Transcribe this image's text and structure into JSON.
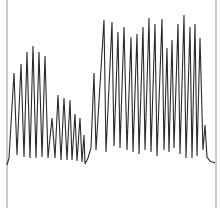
{
  "chart_data": {
    "type": "line",
    "title": "",
    "xlabel": "",
    "ylabel": "",
    "grid": false,
    "legend": null,
    "frame": {
      "left_x": 7,
      "right_x": 216,
      "color": "#9a9a9a"
    },
    "line_color": "#2a2a2a",
    "series": [
      {
        "name": "waveform",
        "points": [
          [
            7,
            165
          ],
          [
            9,
            158
          ],
          [
            14,
            73
          ],
          [
            17,
            155
          ],
          [
            21,
            64
          ],
          [
            24,
            157
          ],
          [
            27,
            52
          ],
          [
            30,
            158
          ],
          [
            33,
            46
          ],
          [
            36,
            158
          ],
          [
            39,
            52
          ],
          [
            42,
            157
          ],
          [
            45,
            56
          ],
          [
            48,
            158
          ],
          [
            52,
            118
          ],
          [
            55,
            158
          ],
          [
            58,
            95
          ],
          [
            61,
            160
          ],
          [
            64,
            98
          ],
          [
            67,
            160
          ],
          [
            70,
            100
          ],
          [
            72,
            160
          ],
          [
            75,
            114
          ],
          [
            77,
            161
          ],
          [
            80,
            118
          ],
          [
            82,
            162
          ],
          [
            84,
            135
          ],
          [
            85,
            164
          ],
          [
            88,
            158
          ],
          [
            91,
            148
          ],
          [
            94,
            73
          ],
          [
            96,
            150
          ],
          [
            104,
            20
          ],
          [
            106,
            152
          ],
          [
            112,
            22
          ],
          [
            114,
            146
          ],
          [
            118,
            32
          ],
          [
            120,
            148
          ],
          [
            124,
            27
          ],
          [
            127,
            150
          ],
          [
            131,
            37
          ],
          [
            133,
            152
          ],
          [
            137,
            34
          ],
          [
            139,
            154
          ],
          [
            143,
            27
          ],
          [
            145,
            150
          ],
          [
            149,
            18
          ],
          [
            151,
            152
          ],
          [
            155,
            24
          ],
          [
            157,
            156
          ],
          [
            162,
            19
          ],
          [
            164,
            150
          ],
          [
            167,
            48
          ],
          [
            169,
            152
          ],
          [
            172,
            40
          ],
          [
            174,
            148
          ],
          [
            178,
            24
          ],
          [
            180,
            154
          ],
          [
            184,
            15
          ],
          [
            186,
            158
          ],
          [
            190,
            27
          ],
          [
            192,
            158
          ],
          [
            195,
            24
          ],
          [
            197,
            156
          ],
          [
            200,
            38
          ],
          [
            203,
            150
          ],
          [
            205,
            125
          ],
          [
            207,
            157
          ],
          [
            210,
            161
          ],
          [
            215,
            163
          ]
        ]
      }
    ],
    "xlim": [
      0,
      220
    ],
    "ylim": [
      0,
      208
    ]
  }
}
